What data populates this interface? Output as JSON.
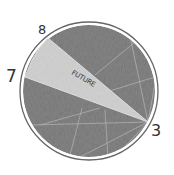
{
  "diagram": {
    "type": "clock-pie-sketch",
    "wedge": {
      "label": "FUTURE",
      "fill": "#cfcfcf"
    },
    "disc_fill": "#8a8a8a",
    "rim_color": "#555555",
    "points": [
      {
        "id": "p8",
        "label": "8"
      },
      {
        "id": "p7",
        "label": "7"
      },
      {
        "id": "p3",
        "label": "3"
      }
    ]
  }
}
